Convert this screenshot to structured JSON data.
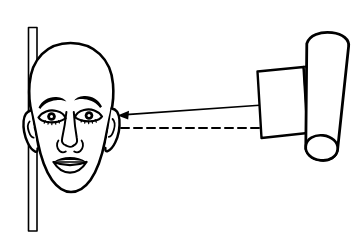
{
  "figure": {
    "title": "Head scanning measurement diagram",
    "background_color": "#ffffff",
    "line_color": "#000000",
    "stroke_width": "2"
  },
  "reference_bar": {
    "name": "vertical reference bar",
    "x": 28,
    "y_top": 27,
    "y_bottom": 231,
    "width": 9,
    "fill": "#ffffff"
  },
  "head": {
    "name": "frontal human head",
    "orientation": "front-facing",
    "bounds": {
      "x_min": 22,
      "x_max": 119,
      "y_min": 43,
      "y_max": 192
    },
    "features": [
      "skull",
      "left-eyebrow",
      "right-eyebrow",
      "left-eye",
      "right-eye",
      "nose",
      "mouth",
      "left-ear",
      "right-ear"
    ]
  },
  "axis_line": {
    "name": "horizontal reference axis",
    "style": "dashed",
    "y": 128,
    "x_start": 30,
    "x_end": 300,
    "dash_pattern": "8 5"
  },
  "pointer_arrow": {
    "name": "aim direction arrow",
    "direction": "left",
    "tip": {
      "x": 118,
      "y": 115
    },
    "tail": {
      "x": 263,
      "y": 105
    },
    "style": "solid with filled triangular head"
  },
  "device": {
    "name": "scanning camera device",
    "parts": [
      {
        "name": "lens-housing",
        "shape": "rectangle",
        "rotation_deg": -4
      },
      {
        "name": "body-cylinder",
        "shape": "cylinder",
        "rotation_deg": 12
      },
      {
        "name": "mounting-bracket",
        "shape": "narrow rectangle"
      }
    ]
  }
}
